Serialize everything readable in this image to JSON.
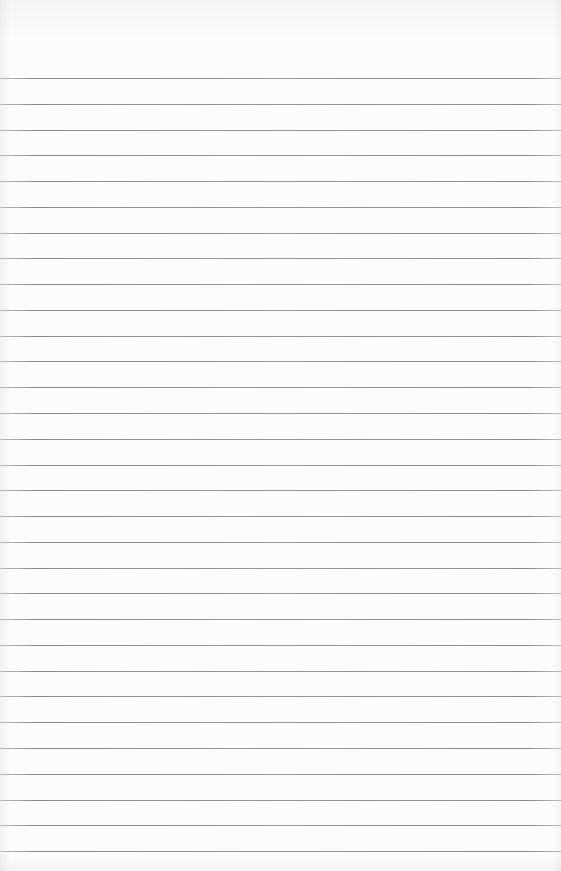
{
  "page": {
    "type": "lined-paper",
    "background_color": "#fcfcfc",
    "rule_color": "#7d7d7d",
    "rule_count": 31,
    "text_content": []
  }
}
